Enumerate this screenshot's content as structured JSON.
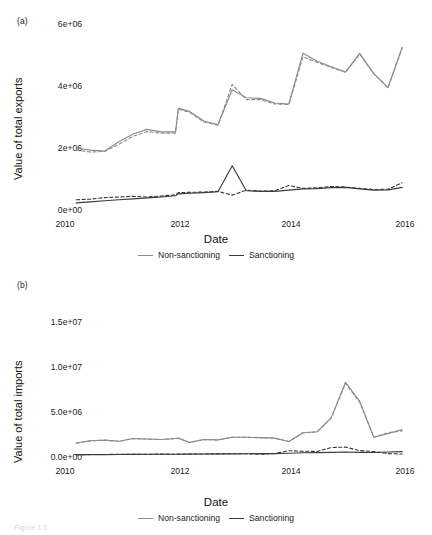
{
  "figure": {
    "caption_faint": "Figure 1.1",
    "panels": [
      {
        "tag": "(a)",
        "ylabel": "Value of total exports",
        "xlabel": "Date",
        "yticks": [
          "0e+00",
          "2e+06",
          "4e+06",
          "6e+06"
        ],
        "ytick_values": [
          0,
          2000000,
          4000000,
          6000000
        ],
        "xticks": [
          "2010",
          "2012",
          "2014",
          "2016"
        ],
        "xtick_values": [
          2010,
          2012,
          2014,
          2016
        ]
      },
      {
        "tag": "(b)",
        "ylabel": "Value of total imports",
        "xlabel": "Date",
        "yticks": [
          "0.0e+00",
          "5.0e+06",
          "1.0e+07",
          "1.5e+07"
        ],
        "ytick_values": [
          0,
          5000000,
          10000000,
          15000000
        ],
        "xticks": [
          "2010",
          "2012",
          "2014",
          "2016"
        ],
        "xtick_values": [
          2010,
          2012,
          2014,
          2016
        ]
      }
    ],
    "legend": {
      "position": "bottom-center",
      "entries": [
        {
          "label": "Non-sanctioning",
          "color": "#8c8c8c",
          "style": "solid"
        },
        {
          "label": "Sanctioning",
          "color": "#3a3a3a",
          "style": "solid"
        }
      ]
    },
    "colors": {
      "non_sanctioning": "#8c8c8c",
      "sanctioning": "#3a3a3a",
      "background": "#ffffff",
      "text": "#222222"
    }
  },
  "chart_data": [
    {
      "type": "line",
      "panel": "(a)",
      "title": "",
      "xlabel": "Date",
      "ylabel": "Value of total exports",
      "xlim": [
        2010.0,
        2016.0
      ],
      "ylim": [
        0,
        6000000
      ],
      "grid": false,
      "legend_position": "bottom-center",
      "x": [
        2010.2,
        2010.45,
        2010.7,
        2010.95,
        2011.2,
        2011.45,
        2011.7,
        2011.95,
        2012.0,
        2012.2,
        2012.45,
        2012.7,
        2012.95,
        2013.2,
        2013.45,
        2013.7,
        2013.95,
        2014.2,
        2014.45,
        2014.7,
        2014.95,
        2015.2,
        2015.45,
        2015.7,
        2015.95
      ],
      "series": [
        {
          "name": "Non-sanctioning (solid)",
          "style": "solid",
          "color": "#8c8c8c",
          "values": [
            2000000,
            1930000,
            1900000,
            2200000,
            2450000,
            2600000,
            2520000,
            2520000,
            3280000,
            3180000,
            2870000,
            2760000,
            3880000,
            3620000,
            3600000,
            3450000,
            3420000,
            5060000,
            4800000,
            4620000,
            4450000,
            5050000,
            4400000,
            3950000,
            5250000
          ]
        },
        {
          "name": "Non-sanctioning (dashed)",
          "style": "dashed",
          "color": "#8c8c8c",
          "values": [
            1930000,
            1870000,
            1890000,
            2120000,
            2380000,
            2530000,
            2480000,
            2480000,
            3250000,
            3150000,
            2840000,
            2730000,
            4050000,
            3560000,
            3560000,
            3420000,
            3400000,
            4940000,
            4760000,
            4600000,
            4440000,
            5030000,
            4390000,
            3940000,
            5230000
          ]
        },
        {
          "name": "Sanctioning (solid)",
          "style": "solid",
          "color": "#3a3a3a",
          "values": [
            230000,
            260000,
            300000,
            330000,
            360000,
            390000,
            420000,
            460000,
            520000,
            540000,
            560000,
            590000,
            1430000,
            620000,
            600000,
            600000,
            640000,
            680000,
            690000,
            720000,
            730000,
            680000,
            640000,
            650000,
            730000
          ]
        },
        {
          "name": "Sanctioning (dashed)",
          "style": "dashed",
          "color": "#3a3a3a",
          "values": [
            330000,
            350000,
            400000,
            420000,
            440000,
            420000,
            450000,
            490000,
            560000,
            570000,
            580000,
            600000,
            480000,
            640000,
            610000,
            620000,
            790000,
            700000,
            720000,
            760000,
            740000,
            700000,
            660000,
            670000,
            880000
          ]
        }
      ]
    },
    {
      "type": "line",
      "panel": "(b)",
      "title": "",
      "xlabel": "Date",
      "ylabel": "Value of total imports",
      "xlim": [
        2010.0,
        2016.0
      ],
      "ylim": [
        0,
        15000000
      ],
      "grid": false,
      "legend_position": "bottom-center",
      "x": [
        2010.2,
        2010.45,
        2010.7,
        2010.95,
        2011.2,
        2011.45,
        2011.7,
        2011.95,
        2012.0,
        2012.2,
        2012.45,
        2012.7,
        2012.95,
        2013.2,
        2013.45,
        2013.7,
        2013.95,
        2014.2,
        2014.45,
        2014.7,
        2014.95,
        2015.2,
        2015.45,
        2015.7,
        2015.95
      ],
      "series": [
        {
          "name": "Non-sanctioning (solid)",
          "style": "solid",
          "color": "#8c8c8c",
          "values": [
            1550000,
            1800000,
            1880000,
            1750000,
            2050000,
            2000000,
            1950000,
            2050000,
            2100000,
            1620000,
            1950000,
            1900000,
            2200000,
            2200000,
            2150000,
            2100000,
            1720000,
            2700000,
            2800000,
            4400000,
            8300000,
            6200000,
            2200000,
            2600000,
            3050000
          ]
        },
        {
          "name": "Non-sanctioning (dashed)",
          "style": "dashed",
          "color": "#8c8c8c",
          "values": [
            1540000,
            1790000,
            1870000,
            1740000,
            2040000,
            1990000,
            1940000,
            2040000,
            2090000,
            1610000,
            1940000,
            1890000,
            2190000,
            2190000,
            2140000,
            2090000,
            1710000,
            2690000,
            2790000,
            4350000,
            8200000,
            6100000,
            2190000,
            2700000,
            2900000
          ]
        },
        {
          "name": "Sanctioning (solid)",
          "style": "solid",
          "color": "#3a3a3a",
          "values": [
            250000,
            260000,
            270000,
            280000,
            290000,
            300000,
            310000,
            300000,
            310000,
            320000,
            330000,
            340000,
            350000,
            360000,
            370000,
            380000,
            420000,
            470000,
            480000,
            520000,
            550000,
            520000,
            500000,
            560000,
            600000
          ]
        },
        {
          "name": "Sanctioning (dashed)",
          "style": "dashed",
          "color": "#3a3a3a",
          "values": [
            260000,
            270000,
            280000,
            300000,
            300000,
            310000,
            320000,
            310000,
            320000,
            330000,
            340000,
            350000,
            360000,
            370000,
            300000,
            390000,
            700000,
            640000,
            620000,
            1050000,
            1100000,
            720000,
            600000,
            380000,
            330000
          ]
        }
      ]
    }
  ]
}
